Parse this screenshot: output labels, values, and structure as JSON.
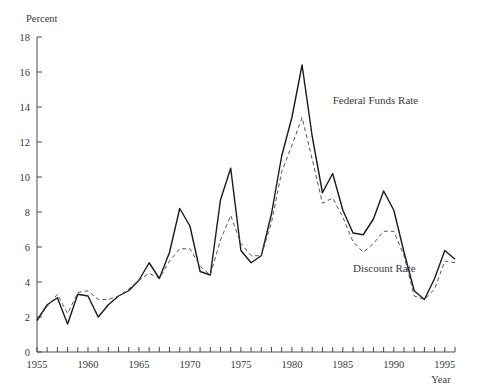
{
  "chart_data": {
    "type": "line",
    "title": "",
    "xlabel": "Year",
    "ylabel": "Percent",
    "xlim": [
      1955,
      1996
    ],
    "ylim": [
      0,
      18
    ],
    "ytick_step": 2,
    "xtick_step": 1,
    "xtick_label_step": 5,
    "grid": false,
    "legend_position": "inline-annotation",
    "yticks": [
      "0",
      "2",
      "4",
      "6",
      "8",
      "10",
      "12",
      "14",
      "16",
      "18"
    ],
    "xticks": [
      "1955",
      "1960",
      "1965",
      "1970",
      "1975",
      "1980",
      "1985",
      "1990",
      "1995"
    ],
    "x": [
      1955,
      1956,
      1957,
      1958,
      1959,
      1960,
      1961,
      1962,
      1963,
      1964,
      1965,
      1966,
      1967,
      1968,
      1969,
      1970,
      1971,
      1972,
      1973,
      1974,
      1975,
      1976,
      1977,
      1978,
      1979,
      1980,
      1981,
      1982,
      1983,
      1984,
      1985,
      1986,
      1987,
      1988,
      1989,
      1990,
      1991,
      1992,
      1993,
      1994,
      1995,
      1996
    ],
    "series": [
      {
        "name": "Federal Funds Rate",
        "style": "solid",
        "color": "#1a1a1a",
        "label_x": 1984.0,
        "label_y": 14.2,
        "values": [
          1.8,
          2.7,
          3.1,
          1.6,
          3.3,
          3.2,
          2.0,
          2.7,
          3.2,
          3.5,
          4.1,
          5.1,
          4.2,
          5.7,
          8.2,
          7.2,
          4.6,
          4.4,
          8.7,
          10.5,
          5.8,
          5.1,
          5.5,
          7.9,
          11.2,
          13.4,
          16.4,
          12.3,
          9.1,
          10.2,
          8.1,
          6.8,
          6.7,
          7.6,
          9.2,
          8.1,
          5.7,
          3.5,
          3.0,
          4.2,
          5.8,
          5.3
        ]
      },
      {
        "name": "Discount Rate",
        "style": "dashed",
        "color": "#555555",
        "label_x": 1986.0,
        "label_y": 4.6,
        "values": [
          1.9,
          2.6,
          3.3,
          2.2,
          3.4,
          3.5,
          3.0,
          3.0,
          3.2,
          3.6,
          4.1,
          4.5,
          4.2,
          5.2,
          5.9,
          5.9,
          4.9,
          4.4,
          6.4,
          7.8,
          6.2,
          5.5,
          5.5,
          7.4,
          10.3,
          11.8,
          13.4,
          11.0,
          8.5,
          8.8,
          7.7,
          6.3,
          5.7,
          6.2,
          6.9,
          6.9,
          5.5,
          3.2,
          3.0,
          3.6,
          5.2,
          5.1
        ]
      }
    ]
  },
  "labels": {
    "y_axis_title": "Percent",
    "x_axis_title": "Year",
    "series_one": "Federal Funds Rate",
    "series_two": "Discount Rate"
  }
}
